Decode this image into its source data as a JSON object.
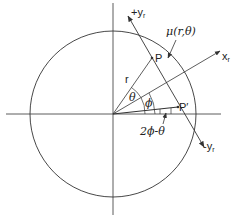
{
  "figure": {
    "colors": {
      "line": "#333333",
      "background": "#ffffff"
    },
    "origin": [
      113,
      114
    ],
    "circle_radius": 83,
    "labels": {
      "plus_y_r": "+y",
      "plus_y_r_sub": "r",
      "minus_y_r": "-y",
      "minus_y_r_sub": "r",
      "x_r": "x",
      "x_r_sub": "r",
      "mu": "μ(r,θ)",
      "point_p": "P",
      "point_p_prime": "P′",
      "radius": "r",
      "theta": "θ",
      "phi": "ϕ",
      "angle_expr": "2ϕ-θ"
    },
    "points": {
      "P": [
        152,
        58
      ],
      "P_prime": [
        178,
        107
      ]
    }
  }
}
